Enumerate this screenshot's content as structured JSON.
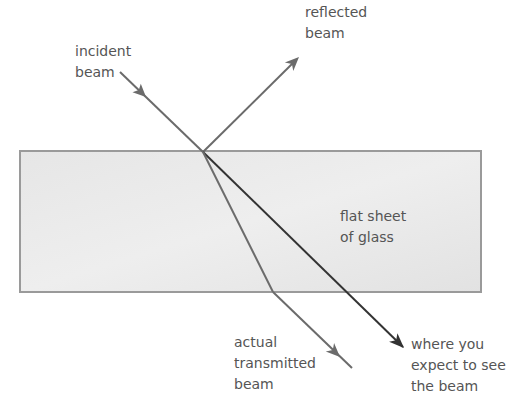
{
  "diagram": {
    "colors": {
      "background": "#ffffff",
      "glass_fill": "#e3e3e3",
      "glass_border": "#9a9a9a",
      "ray": "#6b6b6b",
      "expected_ray": "#333333",
      "text": "#555555"
    },
    "labels": {
      "incident": "incident\nbeam",
      "reflected": "reflected\nbeam",
      "glass": "flat sheet\nof glass",
      "transmitted": "actual\ntransmitted\nbeam",
      "expected": "where you\nexpect to see\nthe beam"
    }
  }
}
